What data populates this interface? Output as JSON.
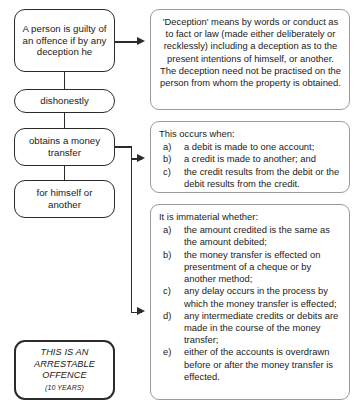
{
  "diagram": {
    "left_nodes": [
      {
        "id": "offence",
        "text": "A person is guilty of an offence if by any deception he"
      },
      {
        "id": "dishonest",
        "text": "dishonestly"
      },
      {
        "id": "obtains",
        "text": "obtains a money transfer"
      },
      {
        "id": "himself",
        "text": "for himself or another"
      }
    ],
    "penalty_node": {
      "line1": "THIS IS AN",
      "line2": "ARRESTABLE",
      "line3": "OFFENCE",
      "years": "(10 YEARS)"
    },
    "panels": [
      {
        "id": "deception",
        "heading": "'Deception' means by words or conduct as to fact or law (made either deliberately or recklessly) including a deception as to the present intentions of himself, or another. The deception need not be practised on the person from whom the property is obtained.",
        "items": []
      },
      {
        "id": "occurs",
        "heading": "This occurs when:",
        "items": [
          {
            "marker": "a)",
            "text": "a debit is made to one account;"
          },
          {
            "marker": "b)",
            "text": "a credit is made to another; and"
          },
          {
            "marker": "c)",
            "text": "the credit results from the debit or the debit results from the credit."
          }
        ]
      },
      {
        "id": "immaterial",
        "heading": "It is immaterial whether:",
        "items": [
          {
            "marker": "a)",
            "text": "the amount credited is the same as the amount debited;"
          },
          {
            "marker": "b)",
            "text": "the money transfer is effected on presentment of a cheque or by another method;"
          },
          {
            "marker": "c)",
            "text": "any delay occurs in the process by which the money transfer is effected;"
          },
          {
            "marker": "d)",
            "text": "any intermediate credits or debits are made in the course of the money transfer;"
          },
          {
            "marker": "e)",
            "text": "either of the accounts is overdrawn before or after the money transfer is effected."
          }
        ]
      }
    ],
    "colors": {
      "node_border": "#2b2b2b",
      "panel_border": "#9b9b9b",
      "text": "#1a1a1a",
      "background": "#ffffff"
    }
  }
}
